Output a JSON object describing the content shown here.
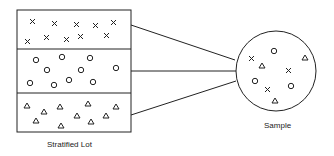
{
  "diagram": {
    "lot_label": "Stratified Lot",
    "sample_label": "Sample",
    "strata": [
      {
        "name": "stratum-x",
        "symbol": "x"
      },
      {
        "name": "stratum-circle",
        "symbol": "circle"
      },
      {
        "name": "stratum-triangle",
        "symbol": "triangle"
      }
    ],
    "line_color": "#222222"
  }
}
